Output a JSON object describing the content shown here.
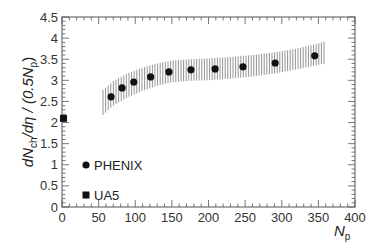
{
  "chart_data": {
    "type": "scatter",
    "title": "",
    "xlabel": "N_p",
    "ylabel": "dN_ch/dη / (0.5N_p)",
    "xlim": [
      0,
      400
    ],
    "ylim": [
      0,
      4.5
    ],
    "x_ticks": [
      0,
      50,
      100,
      150,
      200,
      250,
      300,
      350,
      400
    ],
    "y_ticks": [
      0,
      0.5,
      1,
      1.5,
      2,
      2.5,
      3,
      3.5,
      4,
      4.5
    ],
    "x_tick_labels": [
      "0",
      "50",
      "100",
      "150",
      "200",
      "250",
      "300",
      "350",
      "400"
    ],
    "y_tick_labels": [
      "0",
      "0.5",
      "1",
      "1.5",
      "2",
      "2.5",
      "3",
      "3.5",
      "4",
      "4.5"
    ],
    "grid": false,
    "legend_position": "lower left",
    "series": [
      {
        "name": "PHENIX",
        "marker": "circle",
        "color": "#111111",
        "x": [
          67,
          82,
          98,
          121,
          146,
          176,
          209,
          247,
          291,
          345
        ],
        "y": [
          2.61,
          2.82,
          2.96,
          3.08,
          3.2,
          3.25,
          3.27,
          3.32,
          3.41,
          3.58
        ]
      },
      {
        "name": "UA5",
        "marker": "square",
        "color": "#111111",
        "x": [
          2
        ],
        "y": [
          2.1
        ]
      }
    ],
    "systematic_band": {
      "series": "PHENIX",
      "style": "vertical hatching",
      "color": "#888888",
      "x": [
        56,
        70,
        90,
        110,
        130,
        150,
        175,
        200,
        230,
        260,
        290,
        320,
        345,
        360
      ],
      "upper": [
        2.77,
        2.98,
        3.17,
        3.3,
        3.4,
        3.47,
        3.5,
        3.52,
        3.55,
        3.6,
        3.66,
        3.75,
        3.85,
        3.92
      ],
      "lower": [
        2.18,
        2.4,
        2.6,
        2.75,
        2.87,
        2.95,
        2.99,
        3.0,
        3.04,
        3.09,
        3.16,
        3.26,
        3.35,
        3.4
      ]
    }
  },
  "legend": {
    "items": [
      {
        "label": "PHENIX",
        "marker": "circle"
      },
      {
        "label": "UA5",
        "marker": "square"
      }
    ]
  },
  "axes": {
    "x_title_main": "N",
    "x_title_sub": "p",
    "y_title_parts": [
      "dN",
      "ch",
      "/dη / (0.5N",
      "p",
      ")"
    ]
  }
}
